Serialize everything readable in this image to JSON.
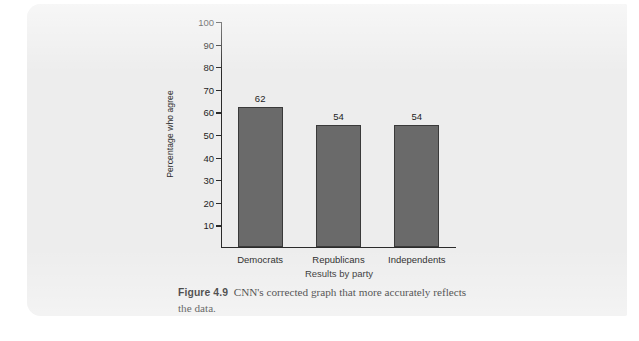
{
  "page": {
    "background_color": "#ededed",
    "sheet_color": "#ededed",
    "outer_color": "#ffffff"
  },
  "figure": {
    "caption_label": "Figure 4.9",
    "caption_text": "CNN's corrected graph that more accurately reflects the data."
  },
  "chart_data": {
    "type": "bar",
    "title": "",
    "subtitle": "",
    "xlabel": "Results by party",
    "ylabel": "Percentage who agree",
    "categories": [
      "Democrats",
      "Republicans",
      "Independents"
    ],
    "values": [
      62,
      54,
      54
    ],
    "data_labels": [
      "62",
      "54",
      "54"
    ],
    "ylim": [
      0,
      100
    ],
    "yticks": [
      10,
      20,
      30,
      40,
      50,
      60,
      70,
      80,
      90,
      100
    ],
    "ytick_labels": [
      "10",
      "20",
      "30",
      "40",
      "50",
      "60",
      "70",
      "80",
      "90",
      "100"
    ],
    "grid": false,
    "legend": false,
    "legend_position": "none",
    "bar_fill_color": "#6a6a6a",
    "bar_border_color": "#3a3a3a",
    "axis_color": "#2b2b2b"
  }
}
